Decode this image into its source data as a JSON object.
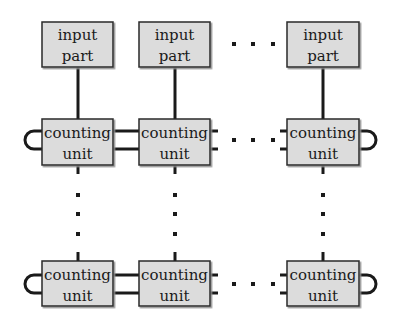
{
  "diagram": {
    "type": "block-diagram",
    "colors": {
      "box_fill": "#dcdcdc",
      "box_border": "#2a2a2a",
      "box_shadow": "#8a8a8a",
      "line": "#1a1a1a",
      "background": "#ffffff"
    },
    "ellipsis_horizontal": "· · ·",
    "ellipsis_vertical": "⋮",
    "input_parts": [
      {
        "line1": "input",
        "line2": "part"
      },
      {
        "line1": "input",
        "line2": "part"
      },
      {
        "line1": "input",
        "line2": "part"
      }
    ],
    "counting_units_top": [
      {
        "line1": "counting",
        "line2": "unit"
      },
      {
        "line1": "counting",
        "line2": "unit"
      },
      {
        "line1": "counting",
        "line2": "unit"
      }
    ],
    "counting_units_bottom": [
      {
        "line1": "counting",
        "line2": "unit"
      },
      {
        "line1": "counting",
        "line2": "unit"
      },
      {
        "line1": "counting",
        "line2": "unit"
      }
    ]
  }
}
